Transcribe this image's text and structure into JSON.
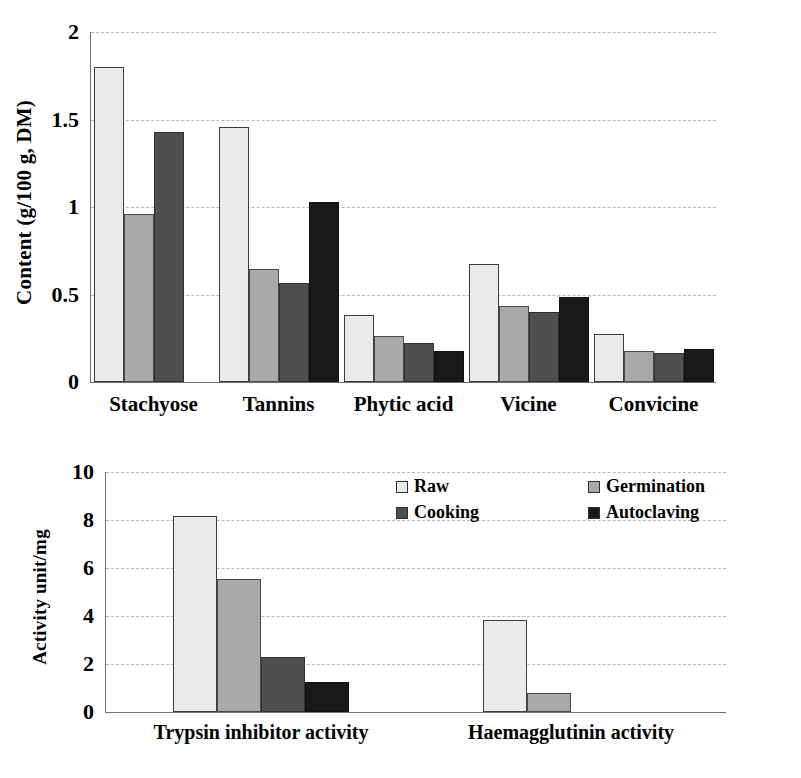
{
  "chart_data": [
    {
      "type": "bar",
      "id": "content-chart",
      "title": "",
      "xlabel": "",
      "ylabel": "Content (g/100 g, DM)",
      "ylim": [
        0,
        2
      ],
      "yticks": [
        "0",
        "0.5",
        "1",
        "1.5",
        "2"
      ],
      "ytick_values": [
        0,
        0.5,
        1,
        1.5,
        2
      ],
      "grid": true,
      "categories": [
        "Stachyose",
        "Tannins",
        "Phytic acid",
        "Vicine",
        "Convicine"
      ],
      "series": [
        {
          "name": "Raw",
          "color": "#ebebeb",
          "values": [
            1.8,
            1.46,
            0.385,
            0.675,
            0.275
          ]
        },
        {
          "name": "Germination",
          "color": "#a9a9a9",
          "values": [
            0.96,
            0.645,
            0.265,
            0.435,
            0.18
          ]
        },
        {
          "name": "Cooking",
          "color": "#4f4f4f",
          "values": [
            1.43,
            0.565,
            0.225,
            0.4,
            0.165
          ]
        },
        {
          "name": "Autoclaving",
          "color": "#191919",
          "values": [
            0.0,
            1.03,
            0.175,
            0.485,
            0.19
          ]
        }
      ]
    },
    {
      "type": "bar",
      "id": "activity-chart",
      "title": "",
      "xlabel": "",
      "ylabel": "Activity unit/mg",
      "ylim": [
        0,
        10
      ],
      "yticks": [
        "0",
        "2",
        "4",
        "6",
        "8",
        "10"
      ],
      "ytick_values": [
        0,
        2,
        4,
        6,
        8,
        10
      ],
      "grid": true,
      "categories": [
        "Trypsin inhibitor activity",
        "Haemagglutinin activity"
      ],
      "series": [
        {
          "name": "Raw",
          "color": "#ebebeb",
          "values": [
            8.15,
            3.85
          ]
        },
        {
          "name": "Germination",
          "color": "#a9a9a9",
          "values": [
            5.55,
            0.8
          ]
        },
        {
          "name": "Cooking",
          "color": "#4f4f4f",
          "values": [
            2.3,
            0.0
          ]
        },
        {
          "name": "Autoclaving",
          "color": "#191919",
          "values": [
            1.25,
            0.0
          ]
        }
      ]
    }
  ],
  "legend": {
    "position": "inside-top-right-of-lower-chart",
    "items": [
      {
        "label": "Raw",
        "color": "#ebebeb"
      },
      {
        "label": "Germination",
        "color": "#a9a9a9"
      },
      {
        "label": "Cooking",
        "color": "#4f4f4f"
      },
      {
        "label": "Autoclaving",
        "color": "#191919"
      }
    ]
  }
}
